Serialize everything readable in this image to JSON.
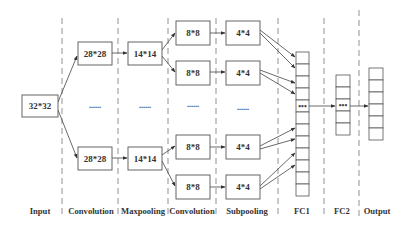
{
  "diagram": {
    "layers": [
      {
        "id": "input",
        "label": "Input",
        "maps": [
          "32*32"
        ]
      },
      {
        "id": "conv1",
        "label": "Convolution",
        "maps": [
          "28*28",
          "28*28"
        ],
        "ellipsis": "......"
      },
      {
        "id": "pool1",
        "label": "Maxpooling",
        "maps": [
          "14*14",
          "14*14"
        ],
        "ellipsis": "......"
      },
      {
        "id": "conv2",
        "label": "Convolution",
        "maps": [
          "8*8",
          "8*8",
          "8*8",
          "8*8"
        ],
        "ellipsis": "......"
      },
      {
        "id": "pool2",
        "label": "Subpooling",
        "maps": [
          "4*4",
          "4*4",
          "4*4",
          "4*4"
        ],
        "ellipsis": "......"
      },
      {
        "id": "fc1",
        "label": "FC1",
        "cells": 12,
        "ellipsis_cell": 4,
        "ellipsis": "•••"
      },
      {
        "id": "fc2",
        "label": "FC2",
        "cells": 5,
        "ellipsis_cell": 2,
        "ellipsis": "•••"
      },
      {
        "id": "output",
        "label": "Output",
        "cells": 6
      }
    ]
  },
  "labels": {
    "input": "Input",
    "conv1": "Convolution",
    "pool1": "Maxpooling",
    "conv2": "Convolution",
    "pool2": "Subpooling",
    "fc1": "FC1",
    "fc2": "FC2",
    "output": "Output"
  },
  "boxes": {
    "input": "32*32",
    "conv1_top": "28*28",
    "conv1_bottom": "28*28",
    "pool1_top": "14*14",
    "pool1_bottom": "14*14",
    "conv2_1": "8*8",
    "conv2_2": "8*8",
    "conv2_3": "8*8",
    "conv2_4": "8*8",
    "pool2_1": "4*4",
    "pool2_2": "4*4",
    "pool2_3": "4*4",
    "pool2_4": "4*4"
  },
  "ellipsis": {
    "maps": "......",
    "cells": "•••"
  }
}
